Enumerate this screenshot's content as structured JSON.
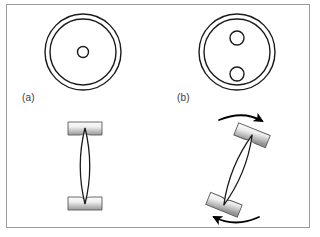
{
  "figure": {
    "width": 320,
    "height": 237,
    "background_color": "#ffffff",
    "frame": {
      "border_color": "#9a9a9a",
      "border_width": 1,
      "x": 6,
      "y": 4,
      "width": 304,
      "height": 224
    },
    "stroke_color": "#1a1a1a",
    "block_fill_light": "#f2f2f2",
    "block_fill_dark": "#9d9d9d",
    "block_edge_color": "#555555",
    "arrow_color": "#000000"
  },
  "panels": [
    {
      "id": "a",
      "caption": "(a)",
      "caption_x": 22,
      "caption_y": 92,
      "top_view": {
        "name": "axial-ring-view-a",
        "center": {
          "x": 83,
          "y": 52
        },
        "rings": [
          {
            "name": "outer-ring",
            "radius": 38
          },
          {
            "name": "inner-ring",
            "radius": 33
          }
        ],
        "bores": [
          {
            "name": "center-bore",
            "cx": 83,
            "cy": 52,
            "r": 5.5
          }
        ],
        "bore_count": 1
      },
      "side_view": {
        "name": "lens-assembly-vertical",
        "rotation_deg": 0,
        "center": {
          "x": 85,
          "y": 166
        },
        "lens": {
          "length": 76,
          "half_width": 9
        },
        "blocks": [
          {
            "name": "top-clamp-block",
            "width": 34,
            "height": 13
          },
          {
            "name": "bottom-clamp-block",
            "width": 34,
            "height": 13
          }
        ],
        "rotation_arrows": []
      }
    },
    {
      "id": "b",
      "caption": "(b)",
      "caption_x": 177,
      "caption_y": 92,
      "top_view": {
        "name": "axial-ring-view-b",
        "center": {
          "x": 237,
          "y": 52
        },
        "rings": [
          {
            "name": "outer-ring",
            "radius": 38
          },
          {
            "name": "inner-ring",
            "radius": 33
          }
        ],
        "bores": [
          {
            "name": "upper-bore",
            "cx": 237,
            "cy": 38,
            "r": 7
          },
          {
            "name": "lower-bore",
            "cx": 237,
            "cy": 74,
            "r": 7
          }
        ],
        "bore_count": 2
      },
      "side_view": {
        "name": "lens-assembly-tilted",
        "rotation_deg": 22,
        "center": {
          "x": 238,
          "y": 170
        },
        "lens": {
          "length": 76,
          "half_width": 9
        },
        "blocks": [
          {
            "name": "top-clamp-block",
            "width": 34,
            "height": 13
          },
          {
            "name": "bottom-clamp-block",
            "width": 34,
            "height": 13
          }
        ],
        "rotation_arrows": [
          {
            "name": "top-rotation-arrow",
            "direction": "clockwise-right",
            "position": "above"
          },
          {
            "name": "bottom-rotation-arrow",
            "direction": "counter-clockwise-left",
            "position": "below"
          }
        ]
      }
    }
  ]
}
